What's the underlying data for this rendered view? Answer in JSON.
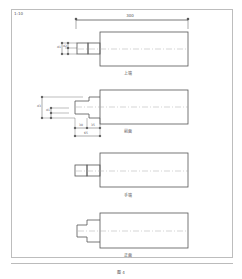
{
  "drawing": {
    "scale_label": "1:10",
    "overall_dimension": "300",
    "views": [
      {
        "label": "上端"
      },
      {
        "label": "前面"
      },
      {
        "label": "手端"
      },
      {
        "label": "正面"
      }
    ],
    "dimensions": {
      "top_view": {
        "d1": "d1",
        "d2": "d2"
      },
      "front_view": {
        "h_total": "d3",
        "h1": "d1",
        "h2": "d2",
        "w1": "30",
        "w2": "35",
        "w_total": "65"
      }
    },
    "figure_caption": "图 4"
  },
  "colors": {
    "line": "#555555",
    "frame": "#bdbdbd",
    "centerline": "#aaaaaa"
  }
}
